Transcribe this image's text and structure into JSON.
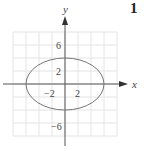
{
  "problem_number": "1",
  "chart_data": {
    "type": "line",
    "title": "",
    "equation": "x^2/36 + y^2/16 = 1",
    "center": [
      0,
      0
    ],
    "semi_axes": {
      "x": 6,
      "y": 4
    },
    "xlabel": "x",
    "ylabel": "y",
    "xlim": [
      -8,
      8
    ],
    "ylim": [
      -8,
      8
    ],
    "grid": true,
    "grid_spacing": 2,
    "x_tick_labels": [
      "-2",
      "2"
    ],
    "y_tick_labels": [
      "6",
      "2",
      "-6"
    ],
    "series": [
      {
        "name": "ellipse",
        "x": [
          6,
          0,
          -6,
          0,
          6
        ],
        "y": [
          0,
          4,
          0,
          -4,
          0
        ]
      }
    ]
  },
  "labels": {
    "x_axis": "x",
    "y_axis": "y",
    "xtick_neg2": "−2",
    "xtick_2": "2",
    "ytick_6": "6",
    "ytick_2": "2",
    "ytick_neg6": "−6"
  },
  "colors": {
    "grid": "#e6e6e6",
    "axis": "#555555",
    "curve": "#777777"
  }
}
